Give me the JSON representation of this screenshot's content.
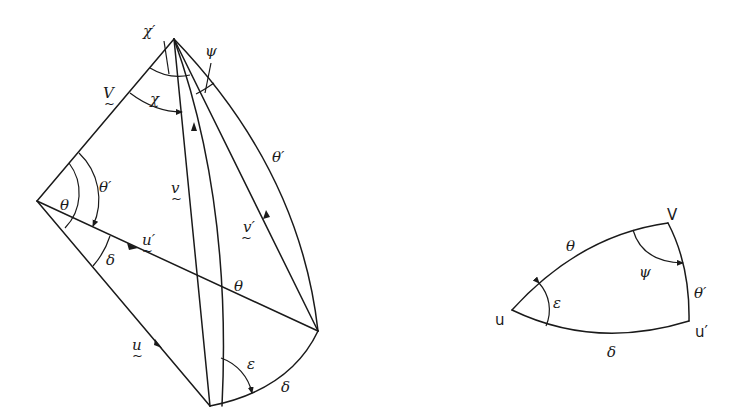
{
  "figure": {
    "left_diagram": {
      "description": "Vector construction on unit sphere: unit vectors V, v, v', u, u' from origin with angles",
      "vectors": {
        "V": "V",
        "v": "v",
        "v_prime": "v′",
        "u": "u",
        "u_prime": "u′"
      },
      "angle_labels": {
        "chi_prime": "χ′",
        "chi": "χ",
        "psi": "ψ",
        "theta_origin": "θ",
        "theta_prime_origin": "θ′",
        "delta_origin": "δ",
        "theta_mid": "θ",
        "theta_prime_arc": "θ′",
        "epsilon": "ε",
        "delta_arc": "δ"
      },
      "tilde": "~"
    },
    "right_diagram": {
      "description": "Spherical triangle with vertices u, V, u'",
      "vertices": {
        "u": "u",
        "V": "V",
        "u_prime": "u′"
      },
      "side_labels": {
        "theta": "θ",
        "theta_prime": "θ′",
        "delta": "δ"
      },
      "angle_labels": {
        "epsilon": "ε",
        "psi": "ψ"
      }
    }
  }
}
